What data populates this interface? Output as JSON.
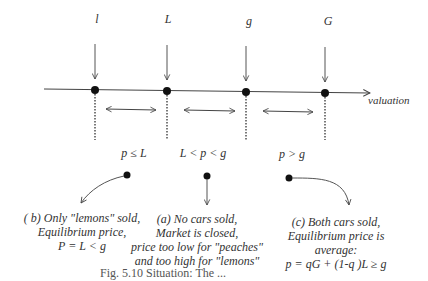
{
  "points": [
    {
      "id": "l",
      "label": "l",
      "x": 95
    },
    {
      "id": "L",
      "label": "L",
      "x": 167
    },
    {
      "id": "g",
      "label": "g",
      "x": 245
    },
    {
      "id": "G",
      "label": "G",
      "x": 325
    }
  ],
  "axis": {
    "label": "valuation"
  },
  "regions": [
    {
      "id": "low",
      "label": "p ≤ L"
    },
    {
      "id": "mid",
      "label": "L < p < g"
    },
    {
      "id": "high",
      "label": "p > g"
    }
  ],
  "outcomes": {
    "b": {
      "line1": "( b) Only \"lemons\" sold,",
      "line2": "Equilibrium price,",
      "line3": "P = L < g"
    },
    "a": {
      "line1": "(a) No cars sold,",
      "line2": "Market is closed,",
      "line3": "price too low for \"peaches\"",
      "line4": "and too high for \"lemons\""
    },
    "c": {
      "line1": "(c) Both cars sold,",
      "line2": "Equilibrium price is",
      "line3": "average:",
      "line4": "p = qG + (1-q )L ≥ g"
    }
  },
  "caption": "Fig. 5.10 Situation: The ..."
}
